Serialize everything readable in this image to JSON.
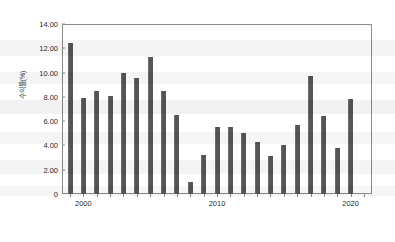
{
  "chart_data": {
    "type": "bar",
    "title": "",
    "subtitle": "",
    "xlabel": "",
    "ylabel": "수익률(%)",
    "ylim": [
      0,
      14
    ],
    "ytick_labels": [
      "14.00",
      "12.00",
      "10.00",
      "8.00",
      "6.00",
      "4.00",
      "2.00",
      "0"
    ],
    "ytick_values": [
      14,
      12,
      10,
      8,
      6,
      4,
      2,
      0
    ],
    "xlim": [
      1998.4,
      2021.6
    ],
    "xtick_labels": [
      "2000",
      "2010",
      "2020"
    ],
    "xtick_values": [
      2000,
      2010,
      2020
    ],
    "grid": false,
    "legend": "none",
    "bar_color": "#555555",
    "frame_color": "#8c8c8c",
    "categories": [
      1999,
      2000,
      2001,
      2002,
      2003,
      2004,
      2005,
      2006,
      2007,
      2008,
      2009,
      2010,
      2011,
      2012,
      2013,
      2014,
      2015,
      2016,
      2017,
      2018,
      2019,
      2020,
      2021
    ],
    "values": [
      12.4,
      7.9,
      8.5,
      8.1,
      9.95,
      9.55,
      11.25,
      8.45,
      6.5,
      0.95,
      3.2,
      5.5,
      5.5,
      5.0,
      4.3,
      3.1,
      4.0,
      5.7,
      9.75,
      6.45,
      3.8,
      7.85,
      0.0
    ],
    "series": [
      {
        "name": "수익률(%)",
        "values": [
          12.4,
          7.9,
          8.5,
          8.1,
          9.95,
          9.55,
          11.25,
          8.45,
          6.5,
          0.95,
          3.2,
          5.5,
          5.5,
          5.0,
          4.3,
          3.1,
          4.0,
          5.7,
          9.75,
          6.45,
          3.8,
          7.85,
          0.0
        ]
      }
    ]
  }
}
